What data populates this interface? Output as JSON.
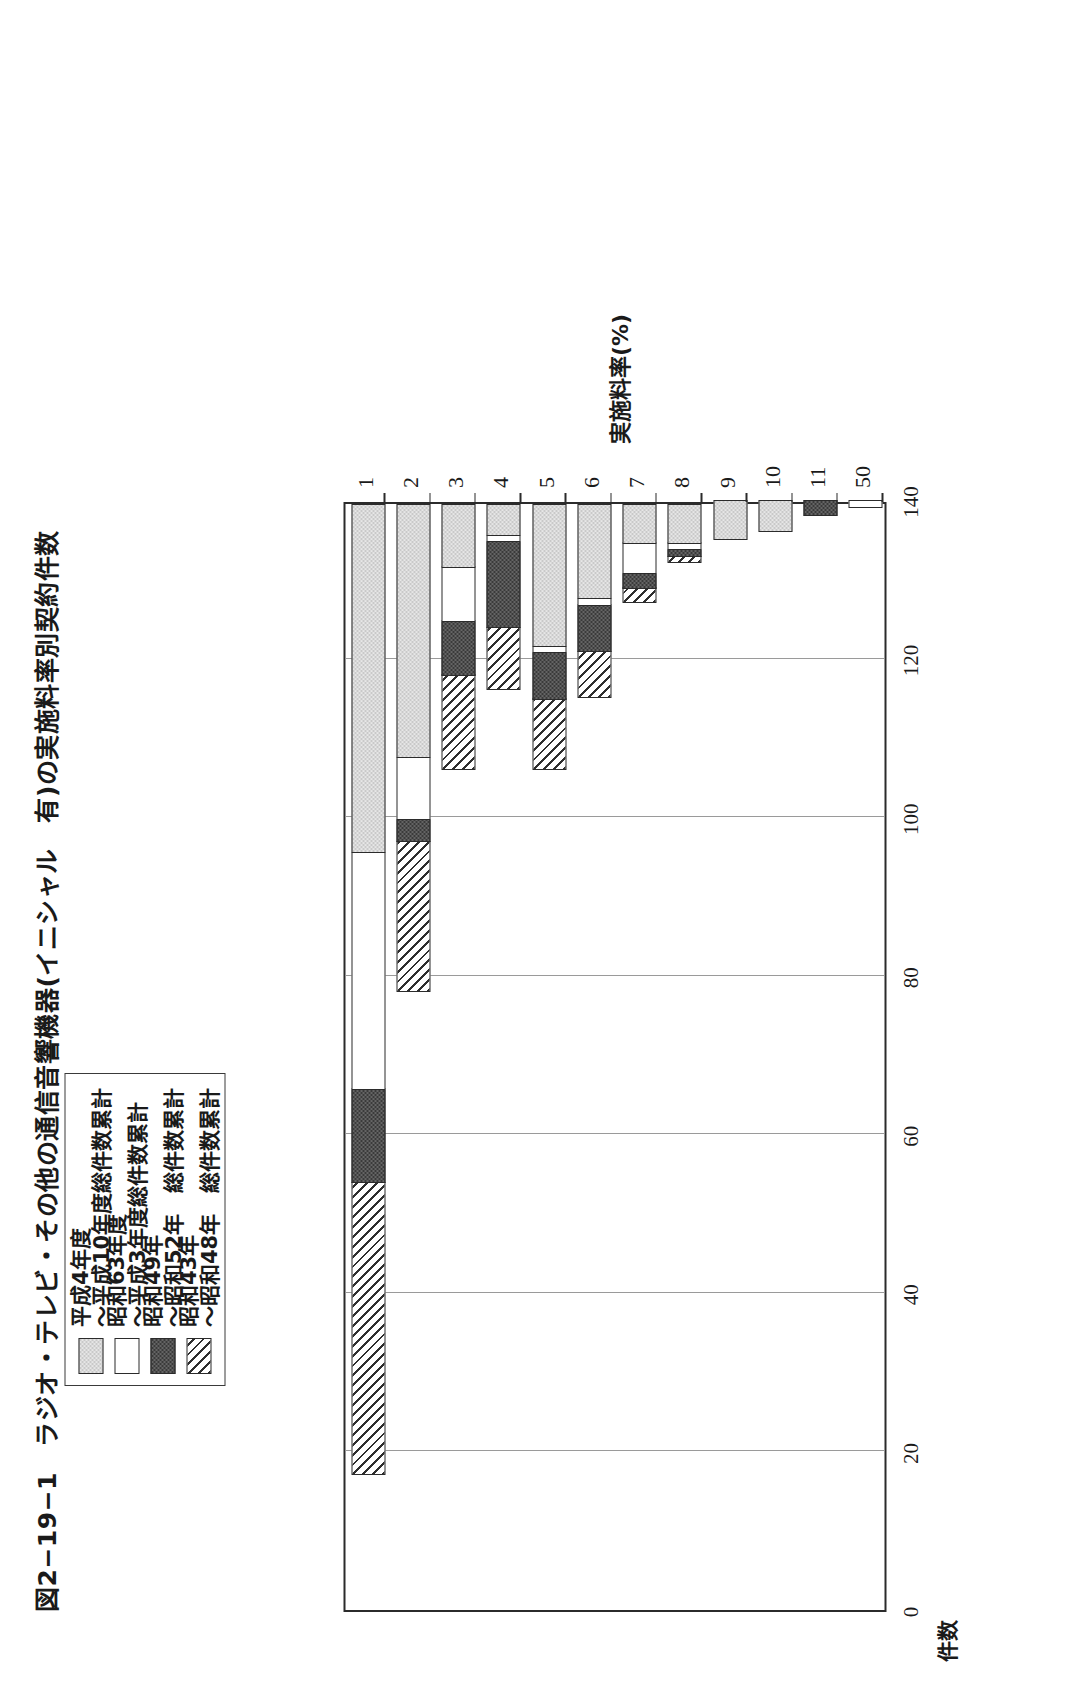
{
  "figure": {
    "title": "図2−19−1　ラジオ・テレビ・その他の通信音響機器(イニシャル　有)の実施料率別契約件数"
  },
  "legend": {
    "items": [
      {
        "swatch": "light-gray-checker",
        "label": "平成4年度\n〜平成10年度総件数累計"
      },
      {
        "swatch": "white",
        "label": "昭和63年度\n〜平成3年度総件数累計"
      },
      {
        "swatch": "dark-fill",
        "label": "昭和49年\n〜昭和52年　総件数累計"
      },
      {
        "swatch": "diagonal-hatch",
        "label": "昭和43年\n〜昭和48年　総件数累計"
      }
    ]
  },
  "chart_data": {
    "type": "bar",
    "orientation": "horizontal-stacked",
    "title": "図2−19−1　ラジオ・テレビ・その他の通信音響機器(イニシャル　有)の実施料率別契約件数",
    "xlabel": "実施料率(%)",
    "ylabel": "件数",
    "categories": [
      "1",
      "2",
      "3",
      "4",
      "5",
      "6",
      "7",
      "8",
      "9",
      "10",
      "11",
      "50"
    ],
    "ylim": [
      0,
      140
    ],
    "yticks": [
      140,
      120,
      100,
      80,
      60,
      40,
      20,
      0
    ],
    "grid": true,
    "legend_position": "top-left",
    "series": [
      {
        "name": "昭和43年〜昭和48年　総件数累計",
        "fill": "diagonal-hatch",
        "values": [
          37,
          19,
          12,
          8,
          9,
          6,
          2,
          1,
          0,
          0,
          0,
          0
        ]
      },
      {
        "name": "昭和49年〜昭和52年　総件数累計",
        "fill": "dark-fill",
        "values": [
          12,
          3,
          7,
          11,
          6,
          6,
          2,
          1,
          0,
          0,
          2,
          0
        ]
      },
      {
        "name": "昭和63年度〜平成3年度総件数累計",
        "fill": "white",
        "values": [
          30,
          8,
          7,
          1,
          1,
          1,
          4,
          1,
          0,
          0,
          0,
          1
        ]
      },
      {
        "name": "平成4年度〜平成10年度総件数累計",
        "fill": "light-gray-checker",
        "values": [
          44,
          32,
          8,
          4,
          18,
          12,
          5,
          5,
          5,
          4,
          0,
          0
        ]
      }
    ],
    "totals": [
      123,
      62,
      34,
      24,
      34,
      25,
      13,
      8,
      5,
      4,
      2,
      1
    ]
  }
}
